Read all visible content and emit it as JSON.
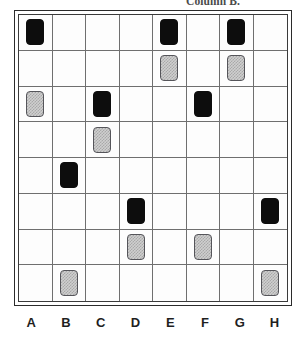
{
  "caption": {
    "text": "Column B."
  },
  "board": {
    "rows": 8,
    "columns": 8,
    "column_labels": [
      "A",
      "B",
      "C",
      "D",
      "E",
      "F",
      "G",
      "H"
    ],
    "token_kinds": {
      "black": "solid-black-tile",
      "gray": "checkered-gray-tile"
    },
    "colors": {
      "black_token": "#0d0d0d",
      "gray_token_fill": "#cfcfcf",
      "gray_token_pattern": "#a9a9a9",
      "gray_token_border": "#55555a",
      "grid_line": "#6f6f6f",
      "frame_outer": "#2b2b2b",
      "frame_inner": "#3a3a3a",
      "background": "#ffffff",
      "label_text": "#1f1f1f"
    },
    "cells": [
      [
        "black",
        "",
        "",
        "",
        "black",
        "",
        "black",
        ""
      ],
      [
        "",
        "",
        "",
        "",
        "gray",
        "",
        "gray",
        ""
      ],
      [
        "gray",
        "",
        "black",
        "",
        "",
        "black",
        "",
        ""
      ],
      [
        "",
        "",
        "gray",
        "",
        "",
        "",
        "",
        ""
      ],
      [
        "",
        "black",
        "",
        "",
        "",
        "",
        "",
        ""
      ],
      [
        "",
        "",
        "",
        "black",
        "",
        "",
        "",
        "black"
      ],
      [
        "",
        "",
        "",
        "gray",
        "",
        "gray",
        "",
        ""
      ],
      [
        "",
        "gray",
        "",
        "",
        "",
        "",
        "",
        "gray"
      ]
    ]
  }
}
